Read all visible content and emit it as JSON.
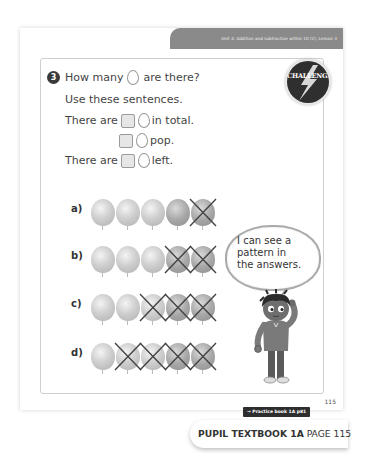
{
  "header": {
    "unit_text": "Unit 4: Addition and subtraction within 10 (2), Lesson 3"
  },
  "question": {
    "number": "3",
    "prompt_before": "How many",
    "prompt_after": "are there?",
    "instruction": "Use these sentences.",
    "sentences": [
      {
        "before": "There are",
        "after": "in total."
      },
      {
        "before": "",
        "after": "pop."
      },
      {
        "before": "There are",
        "after": "left."
      }
    ],
    "challenge_label": "CHALLENGE"
  },
  "rows": [
    {
      "label": "a)",
      "total": 5,
      "popped": 1
    },
    {
      "label": "b)",
      "total": 5,
      "popped": 2
    },
    {
      "label": "c)",
      "total": 5,
      "popped": 3
    },
    {
      "label": "d)",
      "total": 5,
      "popped": 4
    }
  ],
  "speech_bubble": {
    "text_line1": "I can see a",
    "text_line2": "pattern in",
    "text_line3": "the answers."
  },
  "footer": {
    "page_number": "115",
    "practice_link": "→ Practice book 1A p81",
    "book_title": "PUPIL TEXTBOOK 1A",
    "book_page": "PAGE 115"
  },
  "colors": {
    "unit_bar": "#8a8a8a",
    "challenge_badge": "#2f2f2f",
    "practice_tag": "#2e2e2e",
    "balloon_light": "#cfcfcf",
    "balloon_dark": "#a8a8a8",
    "cross": "#444444"
  }
}
